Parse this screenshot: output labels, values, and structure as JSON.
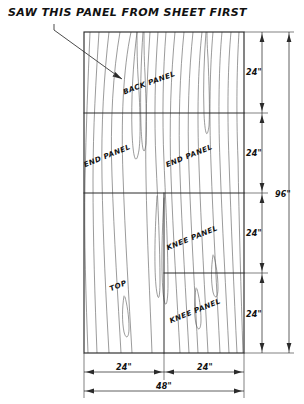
{
  "drawing": {
    "title": "SAW THIS PANEL FROM SHEET FIRST",
    "material": "plywood sheet",
    "sheet": {
      "width_label": "48\"",
      "height_label": "96\""
    },
    "panels": [
      {
        "id": "back-panel",
        "label": "BACK PANEL",
        "band": 1,
        "side": "full",
        "x": 150,
        "y": 85,
        "rotation": -20
      },
      {
        "id": "end-panel-left",
        "label": "END PANEL",
        "band": 2,
        "side": "left",
        "x": 108,
        "y": 158,
        "rotation": -22
      },
      {
        "id": "end-panel-right",
        "label": "END PANEL",
        "band": 2,
        "side": "right",
        "x": 186,
        "y": 158,
        "rotation": -22
      },
      {
        "id": "knee-panel-up",
        "label": "KNEE PANEL",
        "band": 3,
        "side": "right",
        "x": 183,
        "y": 238,
        "rotation": -22
      },
      {
        "id": "top-panel",
        "label": "TOP",
        "band": 4,
        "side": "left",
        "x": 116,
        "y": 287,
        "rotation": -22
      },
      {
        "id": "knee-panel-low",
        "label": "KNEE PANEL",
        "band": 4,
        "side": "right",
        "x": 183,
        "y": 312,
        "rotation": -22
      }
    ],
    "vertical_dimensions": {
      "segments": [
        "24\"",
        "24\"",
        "24\""
      ],
      "segment_labels": [
        {
          "value": "24\"",
          "y": 72
        },
        {
          "value": "24\"",
          "y": 152
        },
        {
          "value": "24\"",
          "y": 232
        },
        {
          "value": "24\"",
          "y": 313
        }
      ],
      "overall": "96\""
    },
    "horizontal_dimensions": {
      "segment_labels": [
        {
          "value": "24\"",
          "x": 124
        },
        {
          "value": "24\"",
          "x": 205
        }
      ],
      "overall": "48\""
    },
    "colors": {
      "ink": "#2b2b2b",
      "grain": "#5d5d5d",
      "paper": "#ffffff"
    }
  }
}
